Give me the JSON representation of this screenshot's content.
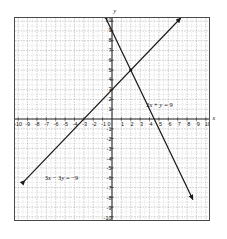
{
  "chart_data": {
    "type": "line",
    "title": "",
    "xlabel": "x",
    "ylabel": "y",
    "xlim": [
      -10,
      10
    ],
    "ylim": [
      -10,
      10
    ],
    "grid": true,
    "minor_grid_subdivisions": 2,
    "legend_position": "inline-annotations",
    "xticks": [
      -10,
      -9,
      -8,
      -7,
      -6,
      -5,
      -4,
      -3,
      -2,
      -1,
      0,
      1,
      2,
      3,
      4,
      5,
      6,
      7,
      8,
      9,
      10
    ],
    "yticks": [
      -10,
      -9,
      -8,
      -7,
      -6,
      -5,
      -4,
      -3,
      -2,
      -1,
      0,
      1,
      2,
      3,
      4,
      5,
      6,
      7,
      8,
      9,
      10
    ],
    "xtick_labels": [
      "-10",
      "-9",
      "-8",
      "-7",
      "-6",
      "-5",
      "-4",
      "-3",
      "-2",
      "-1",
      "0",
      "1",
      "2",
      "3",
      "4",
      "5",
      "6",
      "7",
      "8",
      "9",
      "10"
    ],
    "ytick_labels": [
      "-10",
      "-9",
      "-8",
      "-7",
      "-6",
      "-5",
      "-4",
      "-3",
      "-2",
      "-1",
      "0",
      "1",
      "2",
      "3",
      "4",
      "5",
      "6",
      "7",
      "8",
      "9",
      "10"
    ],
    "intersection": [
      2,
      5
    ],
    "series": [
      {
        "name": "2x + y = 9",
        "label": "2x + y = 9",
        "slope": -2,
        "intercept": 9,
        "points": [
          [
            -0.6,
            10.2
          ],
          [
            8.6,
            -8.2
          ]
        ],
        "arrows": "both",
        "color": "#1a1a1a",
        "label_x": 3.5,
        "label_y": 1.5
      },
      {
        "name": "3x - 3y = -9",
        "label": "3x − 3y = −9",
        "slope": 1,
        "intercept": 3,
        "points": [
          [
            -9.3,
            -6.3
          ],
          [
            7.3,
            10.3
          ]
        ],
        "arrows": "both",
        "color": "#1a1a1a",
        "label_x": -7.2,
        "label_y": -5.9
      }
    ]
  },
  "axes": {
    "x_axis_name": "x",
    "y_axis_name": "y",
    "origin_label": "0"
  },
  "style": {
    "grid_major_color": "#9a9a9a",
    "grid_minor_color": "#c9c9c9",
    "axis_color": "#2a2a2a",
    "border_color": "#4a4a4a",
    "line_color": "#1a1a1a",
    "background": "#ffffff"
  }
}
